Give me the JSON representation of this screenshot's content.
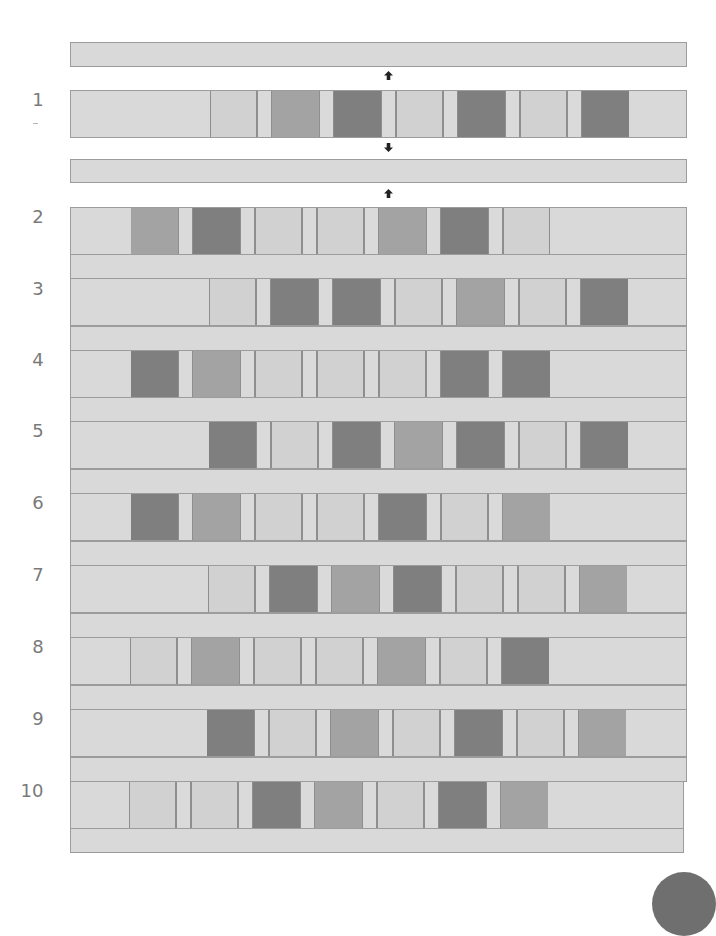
{
  "palette": {
    "background": "#d9d9d9",
    "light": "#d1d1d1",
    "medium": "#a3a3a3",
    "dark": "#7f7f7f",
    "outline": "#9c9c9c",
    "label_text": "#7a7a7a"
  },
  "legend": {
    "L": "light",
    "M": "medium",
    "D": "dark"
  },
  "rows": [
    {
      "label": "1",
      "blocks": [
        "L",
        "M",
        "D",
        "L",
        "D",
        "L",
        "D"
      ]
    },
    {
      "label": "2",
      "blocks": [
        "M",
        "D",
        "L",
        "L",
        "M",
        "D",
        "L"
      ]
    },
    {
      "label": "3",
      "blocks": [
        "L",
        "D",
        "D",
        "L",
        "M",
        "L",
        "D"
      ]
    },
    {
      "label": "4",
      "blocks": [
        "D",
        "M",
        "L",
        "L",
        "L",
        "D",
        "D"
      ]
    },
    {
      "label": "5",
      "blocks": [
        "D",
        "L",
        "D",
        "M",
        "D",
        "L",
        "D"
      ]
    },
    {
      "label": "6",
      "blocks": [
        "D",
        "M",
        "L",
        "L",
        "D",
        "L",
        "M"
      ]
    },
    {
      "label": "7",
      "blocks": [
        "L",
        "D",
        "M",
        "D",
        "L",
        "L",
        "M"
      ]
    },
    {
      "label": "8",
      "blocks": [
        "L",
        "M",
        "L",
        "L",
        "M",
        "L",
        "D"
      ]
    },
    {
      "label": "9",
      "blocks": [
        "D",
        "L",
        "M",
        "L",
        "D",
        "L",
        "M"
      ]
    },
    {
      "label": "10",
      "blocks": [
        "L",
        "L",
        "D",
        "M",
        "L",
        "D",
        "M"
      ]
    }
  ],
  "arrows": [
    "up",
    "down",
    "up"
  ]
}
